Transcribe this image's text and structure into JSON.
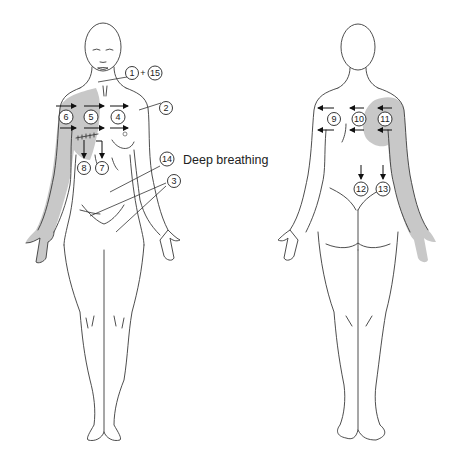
{
  "figure": {
    "shade_color": "#c8c8c8",
    "line_color": "#3a3a3a"
  },
  "front_view": {
    "markers": [
      {
        "id": "1",
        "label": "1"
      },
      {
        "id": "15",
        "label": "15"
      },
      {
        "id": "2",
        "label": "2"
      },
      {
        "id": "3",
        "label": "3"
      },
      {
        "id": "4",
        "label": "4"
      },
      {
        "id": "5",
        "label": "5"
      },
      {
        "id": "6",
        "label": "6"
      },
      {
        "id": "7",
        "label": "7"
      },
      {
        "id": "8",
        "label": "8"
      },
      {
        "id": "14",
        "label": "14"
      }
    ],
    "plus_sign": "+",
    "annotation": "Deep breathing"
  },
  "back_view": {
    "markers": [
      {
        "id": "9",
        "label": "9"
      },
      {
        "id": "10",
        "label": "10"
      },
      {
        "id": "11",
        "label": "11"
      },
      {
        "id": "12",
        "label": "12"
      },
      {
        "id": "13",
        "label": "13"
      }
    ]
  }
}
